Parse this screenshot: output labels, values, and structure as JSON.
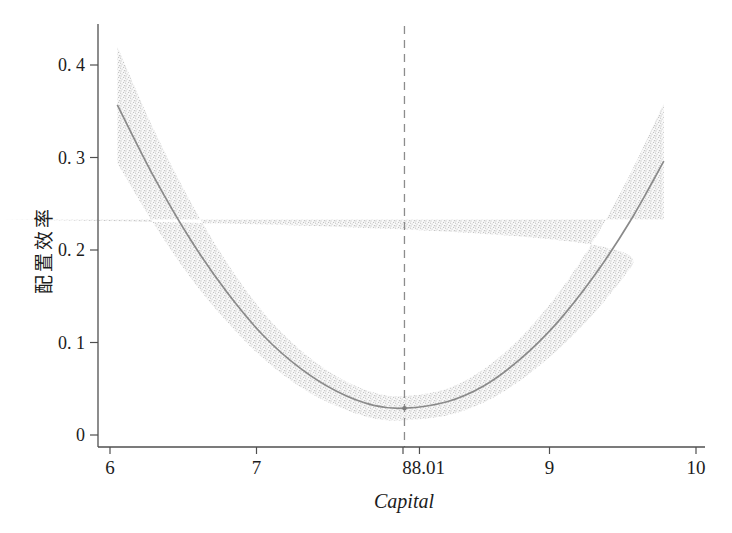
{
  "figure": {
    "background": "#ffffff"
  },
  "chart_data": {
    "type": "line",
    "title": "",
    "xlabel": "Capital",
    "ylabel": "配置效率",
    "grid": false,
    "legend": "none",
    "xlim": [
      5.95,
      10.05
    ],
    "ylim": [
      0,
      0.445
    ],
    "x_axis": {
      "tick_values": [
        6,
        7,
        8,
        9,
        10
      ],
      "tick_labels": [
        "6",
        "7",
        "8",
        "9",
        "10"
      ]
    },
    "y_axis": {
      "tick_values": [
        0,
        0.1,
        0.2,
        0.3,
        0.4
      ],
      "tick_labels": [
        "0",
        "0. 1",
        "0. 2",
        "0. 3",
        "0. 4"
      ]
    },
    "series": [
      {
        "name": "fitted-curve",
        "x": [
          6.05,
          6.3,
          6.55,
          6.8,
          7.05,
          7.3,
          7.55,
          7.8,
          8.01,
          8.3,
          8.55,
          8.8,
          9.05,
          9.3,
          9.55,
          9.78
        ],
        "y": [
          0.357,
          0.279,
          0.211,
          0.154,
          0.107,
          0.072,
          0.047,
          0.032,
          0.029,
          0.036,
          0.053,
          0.082,
          0.121,
          0.171,
          0.231,
          0.296
        ]
      }
    ],
    "confidence_band": {
      "upper": [
        0.42,
        0.33,
        0.252,
        0.186,
        0.132,
        0.092,
        0.063,
        0.046,
        0.042,
        0.05,
        0.071,
        0.105,
        0.151,
        0.21,
        0.282,
        0.359
      ],
      "lower": [
        0.294,
        0.228,
        0.17,
        0.122,
        0.082,
        0.052,
        0.031,
        0.018,
        0.016,
        0.021,
        0.035,
        0.059,
        0.091,
        0.131,
        0.18,
        0.233
      ]
    },
    "reference_line": {
      "x": 8.01,
      "label": "8.01",
      "style": "dashed"
    },
    "turning_point": {
      "x": 8.01,
      "y": 0.029
    },
    "colors": {
      "curve": "#8a8a8a",
      "band_dots": "#c2c2c2",
      "band_tint": "#f3f3f3",
      "dashed_line": "#8c8c8c",
      "axis": "#4f4f4f",
      "text": "#1c1c1c"
    }
  }
}
